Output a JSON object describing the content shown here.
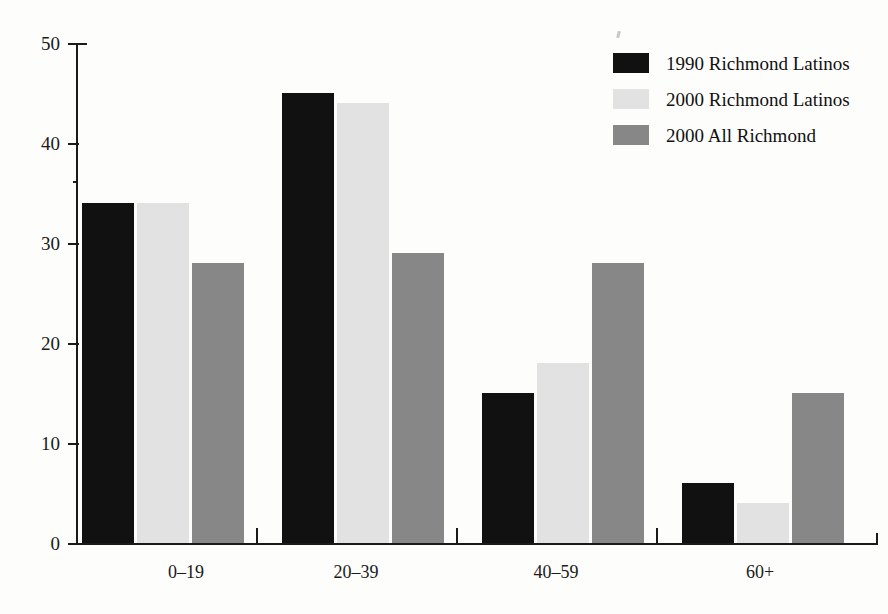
{
  "chart_data": {
    "type": "bar",
    "title": "",
    "subtitle": "",
    "xlabel": "",
    "ylabel": "",
    "categories": [
      "0–19",
      "20–39",
      "40–59",
      "60+"
    ],
    "series": [
      {
        "name": "1990 Richmond Latinos",
        "color": "#111111",
        "values": [
          34,
          45,
          15,
          6
        ]
      },
      {
        "name": "2000 Richmond Latinos",
        "color": "#e2e2e2",
        "values": [
          34,
          44,
          18,
          4
        ]
      },
      {
        "name": "2000 All Richmond",
        "color": "#878787",
        "values": [
          28,
          29,
          28,
          15
        ]
      }
    ],
    "ylim": [
      0,
      50
    ],
    "yticks": [
      0,
      10,
      20,
      30,
      40,
      50
    ],
    "ytick_labels": [
      "0",
      "10",
      "20",
      "30",
      "40",
      "50"
    ],
    "grid": false,
    "legend_position": "top-right",
    "background_color": "#fdfdfb",
    "axis_color": "#1a1a1a"
  },
  "legend": {
    "items": [
      {
        "label": "1990 Richmond Latinos",
        "swatch": "black-swatch"
      },
      {
        "label": "2000 Richmond Latinos",
        "swatch": "light-gray-swatch"
      },
      {
        "label": "2000 All Richmond",
        "swatch": "dark-gray-swatch"
      }
    ]
  }
}
